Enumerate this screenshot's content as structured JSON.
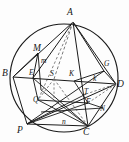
{
  "figure": {
    "kind": "geometry-diagram",
    "stroke_color": "#1a1a1a",
    "background_color": "#fdfdfd",
    "dashed_color": "#6a6a6a",
    "circle": {
      "cx": 64,
      "cy": 78,
      "r": 54
    },
    "points": [
      {
        "name": "A",
        "label": "A",
        "x": 73,
        "y": 22,
        "label_x": 67,
        "label_y": 8
      },
      {
        "name": "B",
        "label": "B",
        "x": 13,
        "y": 77,
        "label_x": 2,
        "label_y": 69
      },
      {
        "name": "D",
        "label": "D",
        "x": 116,
        "y": 84,
        "label_x": 117,
        "label_y": 80
      },
      {
        "name": "P",
        "label": "P",
        "x": 27,
        "y": 124,
        "label_x": 17,
        "label_y": 126
      },
      {
        "name": "C",
        "label": "C",
        "x": 88,
        "y": 126,
        "label_x": 83,
        "label_y": 128
      },
      {
        "name": "M",
        "label": "M",
        "x": 38,
        "y": 53,
        "label_x": 33,
        "label_y": 44
      },
      {
        "name": "E",
        "label": "E",
        "x": 33,
        "y": 78,
        "label_x": 29,
        "label_y": 69
      },
      {
        "name": "S",
        "label": "S",
        "x": 54,
        "y": 79,
        "label_x": 50,
        "label_y": 70
      },
      {
        "name": "K",
        "label": "K",
        "x": 74,
        "y": 81,
        "label_x": 69,
        "label_y": 72
      },
      {
        "name": "G",
        "label": "G",
        "x": 104,
        "y": 71,
        "label_x": 104,
        "label_y": 62
      },
      {
        "name": "Q",
        "label": "Q",
        "x": 38,
        "y": 100,
        "label_x": 33,
        "label_y": 97
      },
      {
        "name": "T",
        "label": "T",
        "x": 86,
        "y": 94,
        "label_x": 84,
        "label_y": 89
      },
      {
        "name": "F",
        "label": "F",
        "x": 88,
        "y": 103,
        "label_x": 86,
        "label_y": 99
      },
      {
        "name": "N",
        "label": "N",
        "x": 103,
        "y": 108,
        "label_x": 101,
        "label_y": 106
      }
    ],
    "segment_labels": [
      {
        "name": "m",
        "label": "m",
        "x": 42,
        "y": 61
      },
      {
        "name": "k",
        "label": "k",
        "x": 93,
        "y": 78
      },
      {
        "name": "n",
        "label": "n",
        "x": 63,
        "y": 120
      }
    ]
  }
}
